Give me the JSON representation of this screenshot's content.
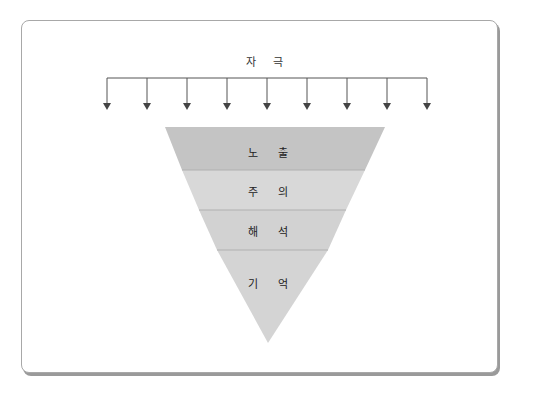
{
  "diagram": {
    "title": "자 극",
    "arrow_count": 9,
    "layers": [
      {
        "label": "노 출",
        "color": "#c4c4c4"
      },
      {
        "label": "주 의",
        "color": "#d6d6d6"
      },
      {
        "label": "해 석",
        "color": "#d2d2d2"
      },
      {
        "label": "기 억",
        "color": "#d3d3d3"
      }
    ],
    "colors": {
      "arrow": "#555555",
      "border": "#a8a8a8",
      "shadow": "#9a9a9a",
      "divider": "#b0b0b0"
    }
  }
}
